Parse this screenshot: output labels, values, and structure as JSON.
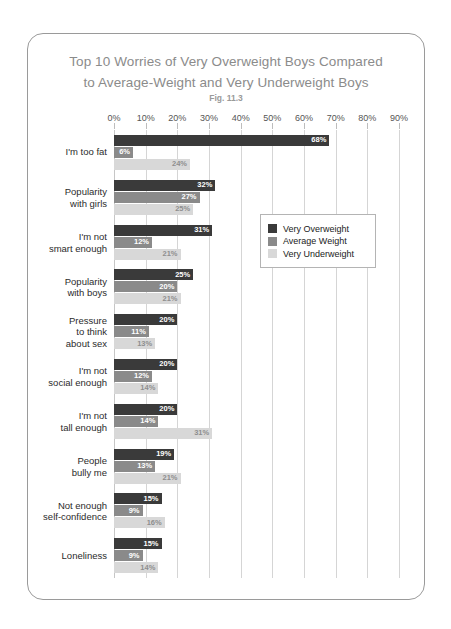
{
  "card": {
    "title_line1": "Top 10 Worries of Very Overweight Boys Compared",
    "title_line2": "to Average-Weight and Very Underweight Boys",
    "subtitle": "Fig. 11.3"
  },
  "legend": {
    "position": "inside-right",
    "items": [
      {
        "label": "Very Overweight",
        "color": "#3a3a3a"
      },
      {
        "label": "Average Weight",
        "color": "#8a8a8a"
      },
      {
        "label": "Very Underweight",
        "color": "#d8d8d8"
      }
    ]
  },
  "chart_data": {
    "type": "bar",
    "orientation": "horizontal",
    "title": "Top 10 Worries of Very Overweight Boys Compared to Average-Weight and Very Underweight Boys",
    "subtitle": "Fig. 11.3",
    "xlabel": "",
    "ylabel": "",
    "xlim": [
      0,
      90
    ],
    "grid": true,
    "xticks": [
      0,
      10,
      20,
      30,
      40,
      50,
      60,
      70,
      80,
      90
    ],
    "xticklabels": [
      "0%",
      "10%",
      "20%",
      "30%",
      "40%",
      "50%",
      "60%",
      "70%",
      "80%",
      "90%"
    ],
    "categories": [
      "I'm too fat",
      "Popularity\nwith girls",
      "I'm not\nsmart enough",
      "Popularity\nwith boys",
      "Pressure\nto think\nabout sex",
      "I'm not\nsocial enough",
      "I'm not\ntall enough",
      "People\nbully me",
      "Not enough\nself-confidence",
      "Loneliness"
    ],
    "series": [
      {
        "name": "Very Overweight",
        "color": "#3a3a3a",
        "values": [
          68,
          32,
          31,
          25,
          20,
          20,
          20,
          19,
          15,
          15
        ],
        "labels": [
          "68%",
          "32%",
          "31%",
          "25%",
          "20%",
          "20%",
          "20%",
          "19%",
          "15%",
          "15%"
        ]
      },
      {
        "name": "Average Weight",
        "color": "#8a8a8a",
        "values": [
          6,
          27,
          12,
          20,
          11,
          12,
          14,
          13,
          9,
          9
        ],
        "labels": [
          "6%",
          "27%",
          "12%",
          "20%",
          "11%",
          "12%",
          "14%",
          "13%",
          "9%",
          "9%"
        ]
      },
      {
        "name": "Very Underweight",
        "color": "#d8d8d8",
        "values": [
          24,
          25,
          21,
          21,
          13,
          14,
          31,
          21,
          16,
          14
        ],
        "labels": [
          "24%",
          "25%",
          "21%",
          "21%",
          "13%",
          "14%",
          "31%",
          "21%",
          "16%",
          "14%"
        ]
      }
    ]
  }
}
